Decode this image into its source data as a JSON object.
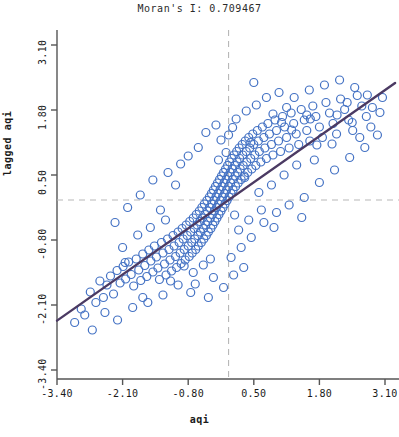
{
  "chart_data": {
    "type": "scatter",
    "title": "Moran's I: 0.709467",
    "xlabel": "aqi",
    "ylabel": "lagged aqi",
    "xlim": [
      -3.4,
      3.1
    ],
    "ylim": [
      -3.4,
      3.1
    ],
    "xticks": [
      "-3.40",
      "-2.10",
      "-0.80",
      "0.50",
      "1.80",
      "3.10"
    ],
    "yticks": [
      "-3.40",
      "-2.10",
      "-0.80",
      "0.50",
      "1.80",
      "3.10"
    ],
    "xtick_values": [
      -3.4,
      -2.1,
      -0.8,
      0.5,
      1.8,
      3.1
    ],
    "ytick_values": [
      -3.4,
      -2.1,
      -0.8,
      0.5,
      1.8,
      3.1
    ],
    "grid": false,
    "legend": null,
    "morans_i": 0.709467,
    "marker": {
      "shape": "open-circle",
      "edge_color": "#4472c4",
      "fill_color": "none",
      "size": 4
    },
    "regression_line": {
      "slope": 0.709467,
      "intercept": 0.0,
      "color": "#4b3a63",
      "width": 2.4,
      "x_from": -3.4,
      "x_to": 3.3
    },
    "reference_lines": {
      "color": "#b8b8b8",
      "style": "dashed",
      "vertical_x": 0.0,
      "horizontal_y": 0.0
    },
    "points": [
      [
        -2.92,
        -2.18
      ],
      [
        -2.74,
        -1.84
      ],
      [
        -2.63,
        -2.05
      ],
      [
        -2.55,
        -1.62
      ],
      [
        -2.48,
        -1.95
      ],
      [
        -2.41,
        -1.7
      ],
      [
        -2.34,
        -1.52
      ],
      [
        -2.28,
        -1.88
      ],
      [
        -2.21,
        -1.41
      ],
      [
        -2.15,
        -1.66
      ],
      [
        -2.09,
        -1.33
      ],
      [
        -2.04,
        -1.58
      ],
      [
        -1.98,
        -1.24
      ],
      [
        -1.93,
        -1.49
      ],
      [
        -1.88,
        -1.72
      ],
      [
        -1.83,
        -1.18
      ],
      [
        -1.78,
        -1.4
      ],
      [
        -1.74,
        -1.61
      ],
      [
        -1.7,
        -1.08
      ],
      [
        -1.66,
        -1.31
      ],
      [
        -1.62,
        -1.53
      ],
      [
        -1.58,
        -1.0
      ],
      [
        -1.54,
        -1.22
      ],
      [
        -1.5,
        -1.44
      ],
      [
        -1.47,
        -0.92
      ],
      [
        -1.43,
        -1.14
      ],
      [
        -1.4,
        -1.36
      ],
      [
        -1.37,
        -1.59
      ],
      [
        -1.33,
        -0.85
      ],
      [
        -1.3,
        -1.06
      ],
      [
        -1.27,
        -1.28
      ],
      [
        -1.24,
        -1.5
      ],
      [
        -1.21,
        -0.78
      ],
      [
        -1.18,
        -0.99
      ],
      [
        -1.16,
        -1.2
      ],
      [
        -1.13,
        -1.42
      ],
      [
        -1.1,
        -0.71
      ],
      [
        -1.08,
        -0.92
      ],
      [
        -1.05,
        -1.13
      ],
      [
        -1.03,
        -1.35
      ],
      [
        -1.0,
        -0.64
      ],
      [
        -0.98,
        -0.85
      ],
      [
        -0.96,
        -1.06
      ],
      [
        -0.94,
        -1.27
      ],
      [
        -0.92,
        -0.57
      ],
      [
        -0.9,
        -0.78
      ],
      [
        -0.88,
        -0.99
      ],
      [
        -0.86,
        -1.2
      ],
      [
        -0.84,
        -0.5
      ],
      [
        -0.82,
        -0.71
      ],
      [
        -0.8,
        -0.92
      ],
      [
        -0.78,
        -1.13
      ],
      [
        -0.77,
        -0.43
      ],
      [
        -0.75,
        -0.64
      ],
      [
        -0.73,
        -0.85
      ],
      [
        -0.72,
        -1.06
      ],
      [
        -0.7,
        -0.36
      ],
      [
        -0.68,
        -0.57
      ],
      [
        -0.67,
        -0.78
      ],
      [
        -0.65,
        -0.99
      ],
      [
        -0.64,
        -0.29
      ],
      [
        -0.62,
        -0.5
      ],
      [
        -0.61,
        -0.71
      ],
      [
        -0.6,
        -0.92
      ],
      [
        -0.58,
        -0.22
      ],
      [
        -0.57,
        -0.43
      ],
      [
        -0.56,
        -0.64
      ],
      [
        -0.54,
        -0.85
      ],
      [
        -0.53,
        -0.15
      ],
      [
        -0.52,
        -0.36
      ],
      [
        -0.5,
        -0.57
      ],
      [
        -0.49,
        -0.78
      ],
      [
        -0.48,
        -0.08
      ],
      [
        -0.47,
        -0.29
      ],
      [
        -0.45,
        -0.5
      ],
      [
        -0.44,
        -0.71
      ],
      [
        -0.43,
        -0.01
      ],
      [
        -0.42,
        -0.22
      ],
      [
        -0.41,
        -0.43
      ],
      [
        -0.4,
        -0.64
      ],
      [
        -0.38,
        0.06
      ],
      [
        -0.37,
        -0.15
      ],
      [
        -0.36,
        -0.36
      ],
      [
        -0.35,
        -0.57
      ],
      [
        -0.34,
        0.13
      ],
      [
        -0.33,
        -0.08
      ],
      [
        -0.32,
        -0.29
      ],
      [
        -0.31,
        -0.5
      ],
      [
        -0.3,
        0.2
      ],
      [
        -0.29,
        -0.01
      ],
      [
        -0.28,
        -0.22
      ],
      [
        -0.27,
        -0.43
      ],
      [
        -0.26,
        0.27
      ],
      [
        -0.25,
        0.06
      ],
      [
        -0.24,
        -0.15
      ],
      [
        -0.23,
        -0.36
      ],
      [
        -0.22,
        0.34
      ],
      [
        -0.21,
        0.13
      ],
      [
        -0.2,
        -0.08
      ],
      [
        -0.19,
        -0.29
      ],
      [
        -0.18,
        0.41
      ],
      [
        -0.17,
        0.2
      ],
      [
        -0.16,
        -0.01
      ],
      [
        -0.15,
        -0.22
      ],
      [
        -0.14,
        0.48
      ],
      [
        -0.13,
        0.27
      ],
      [
        -0.12,
        0.06
      ],
      [
        -0.11,
        -0.15
      ],
      [
        -0.1,
        0.55
      ],
      [
        -0.09,
        0.34
      ],
      [
        -0.08,
        0.13
      ],
      [
        -0.07,
        -0.08
      ],
      [
        -0.06,
        0.62
      ],
      [
        -0.05,
        0.41
      ],
      [
        -0.04,
        0.2
      ],
      [
        -0.03,
        -0.01
      ],
      [
        -0.02,
        0.69
      ],
      [
        -0.01,
        0.48
      ],
      [
        0.0,
        0.27
      ],
      [
        0.01,
        0.06
      ],
      [
        0.02,
        0.76
      ],
      [
        0.03,
        0.55
      ],
      [
        0.04,
        0.34
      ],
      [
        0.05,
        0.13
      ],
      [
        0.06,
        0.83
      ],
      [
        0.07,
        0.62
      ],
      [
        0.08,
        0.41
      ],
      [
        0.09,
        0.2
      ],
      [
        0.11,
        0.9
      ],
      [
        0.12,
        0.69
      ],
      [
        0.13,
        0.48
      ],
      [
        0.14,
        0.27
      ],
      [
        0.16,
        0.97
      ],
      [
        0.17,
        0.76
      ],
      [
        0.18,
        0.55
      ],
      [
        0.19,
        0.34
      ],
      [
        0.21,
        1.04
      ],
      [
        0.22,
        0.83
      ],
      [
        0.23,
        0.62
      ],
      [
        0.25,
        0.41
      ],
      [
        0.27,
        1.11
      ],
      [
        0.28,
        0.9
      ],
      [
        0.29,
        0.69
      ],
      [
        0.31,
        0.48
      ],
      [
        0.33,
        1.18
      ],
      [
        0.35,
        0.97
      ],
      [
        0.36,
        0.76
      ],
      [
        0.38,
        0.55
      ],
      [
        0.4,
        1.25
      ],
      [
        0.42,
        1.04
      ],
      [
        0.44,
        0.83
      ],
      [
        0.46,
        0.62
      ],
      [
        0.48,
        1.32
      ],
      [
        0.5,
        1.11
      ],
      [
        0.52,
        0.9
      ],
      [
        0.54,
        0.69
      ],
      [
        0.57,
        1.39
      ],
      [
        0.59,
        1.18
      ],
      [
        0.61,
        0.97
      ],
      [
        0.64,
        0.76
      ],
      [
        0.67,
        1.46
      ],
      [
        0.7,
        1.25
      ],
      [
        0.72,
        1.04
      ],
      [
        0.75,
        0.83
      ],
      [
        0.78,
        1.53
      ],
      [
        0.81,
        1.32
      ],
      [
        0.85,
        1.11
      ],
      [
        0.88,
        0.9
      ],
      [
        0.92,
        1.6
      ],
      [
        0.95,
        1.39
      ],
      [
        0.99,
        1.18
      ],
      [
        1.03,
        0.97
      ],
      [
        1.07,
        1.67
      ],
      [
        1.11,
        1.46
      ],
      [
        1.15,
        1.25
      ],
      [
        1.2,
        1.04
      ],
      [
        1.24,
        1.74
      ],
      [
        1.29,
        1.53
      ],
      [
        1.34,
        1.32
      ],
      [
        1.39,
        1.11
      ],
      [
        1.44,
        1.81
      ],
      [
        1.5,
        1.6
      ],
      [
        1.55,
        1.39
      ],
      [
        1.61,
        1.18
      ],
      [
        1.67,
        1.88
      ],
      [
        1.73,
        1.67
      ],
      [
        1.8,
        1.46
      ],
      [
        1.86,
        1.25
      ],
      [
        1.93,
        1.95
      ],
      [
        2.0,
        1.74
      ],
      [
        2.07,
        1.53
      ],
      [
        2.14,
        1.32
      ],
      [
        2.22,
        2.02
      ],
      [
        2.3,
        1.81
      ],
      [
        2.38,
        1.6
      ],
      [
        2.46,
        1.39
      ],
      [
        2.55,
        2.09
      ],
      [
        2.64,
        1.88
      ],
      [
        2.73,
        1.67
      ],
      [
        2.82,
        1.46
      ],
      [
        -1.5,
        0.4
      ],
      [
        -1.2,
        0.55
      ],
      [
        -0.95,
        0.72
      ],
      [
        -2.0,
        -0.15
      ],
      [
        -1.75,
        0.1
      ],
      [
        -2.25,
        -0.45
      ],
      [
        -0.6,
        1.05
      ],
      [
        -0.8,
        0.88
      ],
      [
        -1.05,
        0.3
      ],
      [
        -1.35,
        -0.2
      ],
      [
        -0.45,
        1.35
      ],
      [
        -0.25,
        1.5
      ],
      [
        0.15,
        1.62
      ],
      [
        0.35,
        1.78
      ],
      [
        0.55,
        1.9
      ],
      [
        -0.15,
        1.2
      ],
      [
        0.75,
        2.05
      ],
      [
        1.0,
        2.15
      ],
      [
        1.3,
        2.05
      ],
      [
        1.6,
        2.2
      ],
      [
        1.9,
        2.3
      ],
      [
        2.2,
        2.4
      ],
      [
        2.5,
        2.25
      ],
      [
        2.75,
        2.1
      ],
      [
        -0.7,
        -1.45
      ],
      [
        -0.5,
        -1.3
      ],
      [
        -0.3,
        -1.55
      ],
      [
        0.05,
        -1.15
      ],
      [
        0.25,
        -0.95
      ],
      [
        0.45,
        -0.75
      ],
      [
        0.7,
        -0.45
      ],
      [
        0.95,
        -0.25
      ],
      [
        1.2,
        -0.1
      ],
      [
        1.5,
        0.05
      ],
      [
        1.8,
        0.35
      ],
      [
        2.1,
        0.6
      ],
      [
        2.4,
        0.85
      ],
      [
        2.7,
        1.05
      ],
      [
        2.95,
        1.3
      ],
      [
        3.0,
        1.75
      ],
      [
        -3.05,
        -2.45
      ],
      [
        -2.85,
        -2.3
      ],
      [
        -2.2,
        -2.4
      ],
      [
        -1.9,
        -2.15
      ],
      [
        -1.6,
        -2.05
      ],
      [
        -1.3,
        -1.9
      ],
      [
        -1.0,
        -1.7
      ],
      [
        -0.75,
        -1.85
      ],
      [
        0.6,
        0.15
      ],
      [
        0.85,
        0.3
      ],
      [
        1.1,
        0.5
      ],
      [
        1.35,
        0.7
      ],
      [
        0.2,
        -0.6
      ],
      [
        0.4,
        -0.4
      ],
      [
        0.65,
        -0.2
      ],
      [
        0.9,
        -0.55
      ],
      [
        1.45,
        -0.35
      ],
      [
        1.7,
        0.8
      ],
      [
        1.15,
        1.85
      ],
      [
        0.5,
        2.35
      ],
      [
        -0.4,
        -1.95
      ],
      [
        -0.1,
        -1.75
      ],
      [
        0.1,
        -1.5
      ],
      [
        0.3,
        -1.35
      ],
      [
        -2.1,
        -0.95
      ],
      [
        -1.8,
        -0.7
      ],
      [
        -1.55,
        -0.55
      ],
      [
        -1.25,
        -0.4
      ],
      [
        -0.05,
        0.95
      ],
      [
        0.08,
        1.45
      ],
      [
        0.44,
        1.15
      ],
      [
        0.88,
        1.72
      ],
      [
        1.62,
        1.62
      ],
      [
        2.05,
        1.12
      ],
      [
        2.35,
        1.95
      ],
      [
        2.6,
        1.25
      ],
      [
        -2.7,
        -2.6
      ],
      [
        -2.45,
        -2.25
      ],
      [
        -2.05,
        -1.25
      ],
      [
        -1.7,
        -1.95
      ],
      [
        -1.15,
        -1.62
      ],
      [
        -0.88,
        -1.32
      ],
      [
        -0.66,
        -1.68
      ],
      [
        -0.36,
        -1.18
      ],
      [
        1.05,
        1.55
      ],
      [
        1.25,
        1.4
      ],
      [
        1.55,
        1.7
      ],
      [
        1.75,
        1.1
      ],
      [
        2.15,
        1.7
      ],
      [
        2.45,
        1.55
      ],
      [
        2.85,
        1.85
      ],
      [
        3.05,
        2.05
      ],
      [
        -0.2,
        0.8
      ],
      [
        0.0,
        1.3
      ],
      [
        0.12,
        -0.3
      ],
      [
        0.32,
        0.45
      ]
    ]
  }
}
